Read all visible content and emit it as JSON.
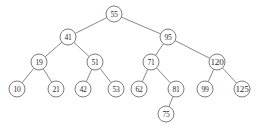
{
  "diagram": {
    "type": "binary-search-tree",
    "title": "",
    "background_color": "#ffffff",
    "node_fill_color": "#ffffff",
    "node_stroke_color": "#6e6e6e",
    "edge_color": "#7a7a7a",
    "text_color": "#2b2b2b",
    "node_radius": 8,
    "nodes": [
      {
        "id": "n55",
        "label": "55",
        "x": 114,
        "y": 14,
        "level": 0
      },
      {
        "id": "n41",
        "label": "41",
        "x": 68,
        "y": 37,
        "level": 1
      },
      {
        "id": "n95",
        "label": "95",
        "x": 168,
        "y": 37,
        "level": 1
      },
      {
        "id": "n19",
        "label": "19",
        "x": 39,
        "y": 62,
        "level": 2
      },
      {
        "id": "n51",
        "label": "51",
        "x": 95,
        "y": 62,
        "level": 2
      },
      {
        "id": "n71",
        "label": "71",
        "x": 151,
        "y": 62,
        "level": 2
      },
      {
        "id": "n120",
        "label": "120",
        "x": 217,
        "y": 62,
        "level": 2
      },
      {
        "id": "n10",
        "label": "10",
        "x": 17,
        "y": 89,
        "level": 3
      },
      {
        "id": "n21",
        "label": "21",
        "x": 56,
        "y": 89,
        "level": 3
      },
      {
        "id": "n42",
        "label": "42",
        "x": 83,
        "y": 89,
        "level": 3
      },
      {
        "id": "n53",
        "label": "53",
        "x": 116,
        "y": 89,
        "level": 3
      },
      {
        "id": "n62",
        "label": "62",
        "x": 139,
        "y": 89,
        "level": 3
      },
      {
        "id": "n81",
        "label": "81",
        "x": 176,
        "y": 89,
        "level": 3
      },
      {
        "id": "n99",
        "label": "99",
        "x": 205,
        "y": 89,
        "level": 3
      },
      {
        "id": "n125",
        "label": "125",
        "x": 242,
        "y": 89,
        "level": 3
      },
      {
        "id": "n75",
        "label": "75",
        "x": 166,
        "y": 114,
        "level": 4
      }
    ],
    "edges": [
      {
        "from": "n55",
        "to": "n41",
        "side": "left"
      },
      {
        "from": "n55",
        "to": "n95",
        "side": "right"
      },
      {
        "from": "n41",
        "to": "n19",
        "side": "left"
      },
      {
        "from": "n41",
        "to": "n51",
        "side": "right"
      },
      {
        "from": "n95",
        "to": "n71",
        "side": "left"
      },
      {
        "from": "n95",
        "to": "n120",
        "side": "right"
      },
      {
        "from": "n19",
        "to": "n10",
        "side": "left"
      },
      {
        "from": "n19",
        "to": "n21",
        "side": "right"
      },
      {
        "from": "n51",
        "to": "n42",
        "side": "left"
      },
      {
        "from": "n51",
        "to": "n53",
        "side": "right"
      },
      {
        "from": "n71",
        "to": "n62",
        "side": "left"
      },
      {
        "from": "n71",
        "to": "n81",
        "side": "right"
      },
      {
        "from": "n120",
        "to": "n99",
        "side": "left"
      },
      {
        "from": "n120",
        "to": "n125",
        "side": "right"
      },
      {
        "from": "n81",
        "to": "n75",
        "side": "left"
      }
    ]
  }
}
